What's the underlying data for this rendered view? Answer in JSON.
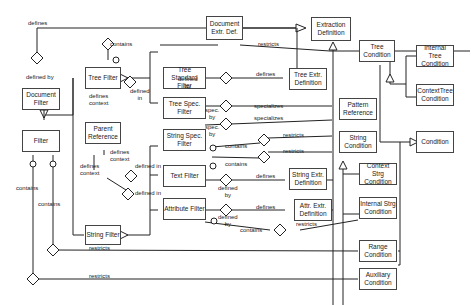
{
  "diagram": {
    "type": "UML class diagram",
    "classes": {
      "document_extr_def": "Document\nExtr. Def.",
      "extraction_definition": "Extraction\nDefinition",
      "tree_condition": "Tree\nCondition",
      "internal_tree_condition": "Internal Tree\nCondition",
      "context_tree_condition": "ContextTree\nCondition",
      "document_filter": "Document\nFilter",
      "tree_filter": "Tree Filter",
      "tree_standard_filter": "Tree Standard\nFilter",
      "tree_extr_definition": "Tree Extr.\nDefinition",
      "tree_spec_filter": "Tree Spec.\nFilter",
      "pattern_reference": "Pattern\nReference",
      "parent_reference": "Parent\nReference",
      "filter": "Filter",
      "string_spec_filter": "String Spec.\nFilter",
      "string_condition": "String\nCondition",
      "condition": "Condition",
      "text_filter": "Text Filter",
      "string_extr_definition": "String Extr.\nDefinition",
      "context_strg_condition": "Context Strg\nCondition",
      "string_filter": "String Filter",
      "attribute_filter": "Attribute Filter",
      "attr_extr_definition": "Attr. Extr.\nDefinition",
      "internal_strg_condition": "Internal Strg\nCondition",
      "range_condition": "Range\nCondition",
      "auxiliary_condition": "Auxiliary\nCondition"
    },
    "labels": {
      "defines_top": "defines",
      "defined_by_doc": "defined by",
      "contains_top": "contains",
      "restricts_top": "restricts",
      "defines_context_tree": "defines\ncontext",
      "defined_in_tree": "defined\nin",
      "defined_by_tsf": "defined\nby",
      "defines_tsf": "defines",
      "spec_by_tree": "spec.\nby",
      "specializes_tree": "specializes",
      "spec_by_string": "spec.\nby",
      "specializes_string": "specializes",
      "restricts_ssf": "restricts",
      "contains_ssf": "contains",
      "defines_context_pr": "defines\ncontext",
      "defines_context_sf": "defines\ncontext",
      "defined_in_1": "defined in",
      "contains_tf": "contains",
      "restricts_tf": "restricts",
      "defined_in_2": "defined in",
      "defined_by_tf": "defined\nby",
      "defines_tf": "defines",
      "defined_by_af": "defined\nby",
      "defines_af": "defines",
      "contains_af": "contains",
      "restricts_af": "restricts",
      "contains_filter_1": "contains",
      "contains_filter_2": "contains",
      "restricts_range": "restricts",
      "restricts_aux": "restricts"
    }
  }
}
